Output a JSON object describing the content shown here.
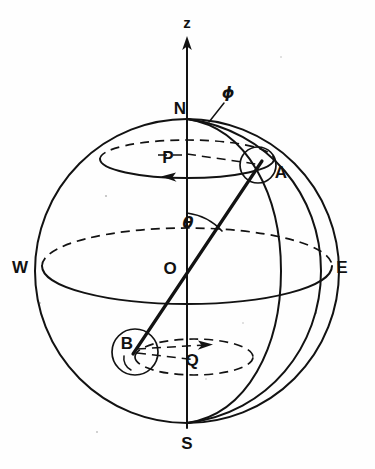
{
  "figure": {
    "kind": "spherical-coordinates-diagram",
    "background_color": "#fefefe",
    "ink_color": "#121212"
  },
  "labels": {
    "z_axis": "z",
    "north_pole": "N",
    "south_pole": "S",
    "west": "W",
    "east": "E",
    "origin": "O",
    "point_a": "A",
    "point_b": "B",
    "circle_p": "P",
    "circle_q": "Q",
    "polar_angle": "θ",
    "azimuth_angle": "ϕ"
  },
  "geometry": {
    "sphere": {
      "cx": 187,
      "cy": 271,
      "r": 152
    },
    "z_axis": {
      "x": 187,
      "y_top": 38,
      "y_bottom": 428
    },
    "points": {
      "N": {
        "x": 187,
        "y": 119
      },
      "S": {
        "x": 187,
        "y": 423
      },
      "W": {
        "x": 42,
        "y": 266
      },
      "E": {
        "x": 332,
        "y": 266
      },
      "O": {
        "x": 187,
        "y": 271
      },
      "A": {
        "x": 258,
        "y": 166
      },
      "B": {
        "x": 135,
        "y": 352
      }
    },
    "latitude_circle_P": {
      "cx": 187,
      "cy": 159,
      "rx": 87,
      "ry": 19
    },
    "latitude_circle_Q": {
      "cx": 194,
      "cy": 357,
      "rx": 59,
      "ry": 18
    },
    "equator": {
      "cx": 187,
      "cy": 266,
      "rx": 145,
      "ry": 38
    },
    "marker_circle_radius": 19,
    "theta_arc_radius": 58,
    "theta_degrees_from_z": 37
  },
  "label_positions": {
    "z": {
      "x": 187,
      "y": 28
    },
    "N": {
      "x": 178,
      "y": 113
    },
    "phi": {
      "x": 228,
      "y": 97
    },
    "P": {
      "x": 169,
      "y": 158
    },
    "A": {
      "x": 279,
      "y": 176
    },
    "theta": {
      "x": 188,
      "y": 225
    },
    "W": {
      "x": 18,
      "y": 272
    },
    "O": {
      "x": 170,
      "y": 272
    },
    "E": {
      "x": 339,
      "y": 272
    },
    "B": {
      "x": 124,
      "y": 348
    },
    "Q": {
      "x": 191,
      "y": 364
    },
    "S": {
      "x": 180,
      "y": 447
    }
  }
}
